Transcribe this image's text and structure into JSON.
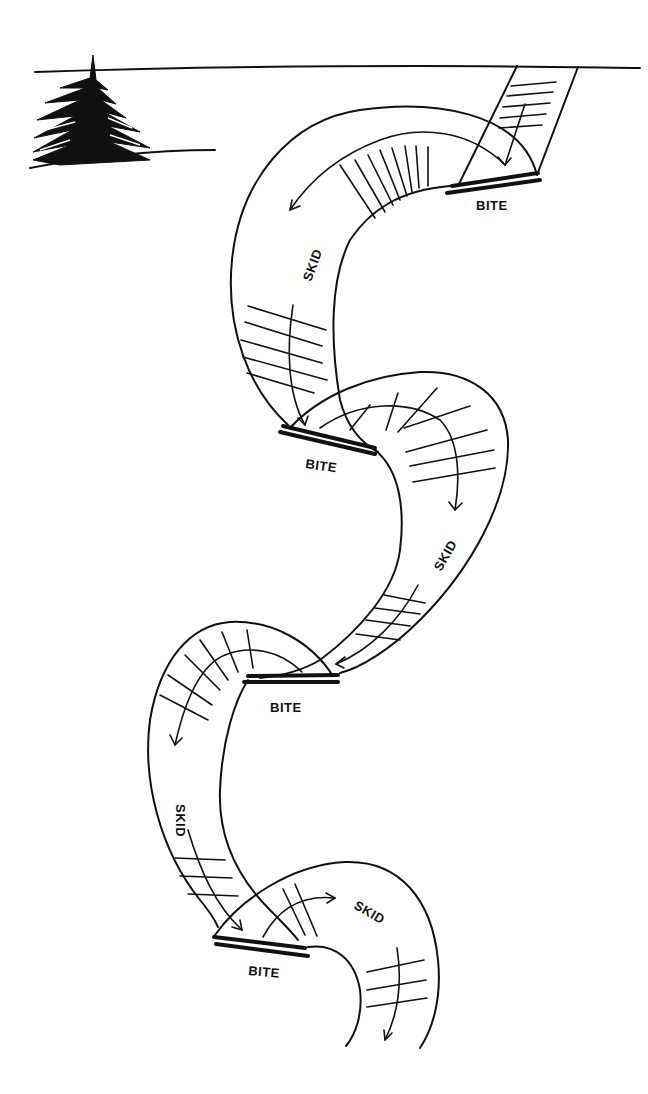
{
  "labels": {
    "bite_1": "BITE",
    "skid_1": "SKID",
    "bite_2": "BITE",
    "skid_2": "SKID",
    "bite_3": "BITE",
    "skid_3": "SKID",
    "bite_4": "BITE",
    "skid_4": "SKID"
  },
  "colors": {
    "ink": "#111111",
    "paper": "#ffffff"
  }
}
